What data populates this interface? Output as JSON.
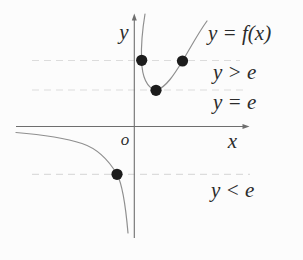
{
  "figure": {
    "curve_label": "y = f(x)",
    "axis": {
      "x_label": "x",
      "y_label": "y",
      "origin_label": "o"
    },
    "regions": {
      "above": "y > e",
      "equal": "y = e",
      "below": "y < e"
    },
    "dashed_lines": [
      {
        "name": "level-above-e",
        "y": 60.5,
        "x1": 32,
        "x2": 240
      },
      {
        "name": "level-equal-e",
        "y": 90,
        "x1": 32,
        "x2": 248
      },
      {
        "name": "level-below-e",
        "y": 174.3,
        "x1": 32,
        "x2": 250
      }
    ],
    "dots": [
      {
        "name": "intersection-left-upper",
        "x": 141.7,
        "y": 60.3
      },
      {
        "name": "intersection-right-upper",
        "x": 182.5,
        "y": 61
      },
      {
        "name": "minimum-point",
        "x": 156,
        "y": 90.3
      },
      {
        "name": "intersection-lower-branch",
        "x": 117,
        "y": 174.3
      }
    ],
    "dot_radius": 5.6,
    "colors": {
      "background": "#fcfcfc",
      "curve": "#8f8f8f",
      "axis": "#6e6e6e",
      "dashed": "#dcdcdc",
      "dot": "#1c1c1c",
      "text": "#2b2b2b"
    }
  }
}
